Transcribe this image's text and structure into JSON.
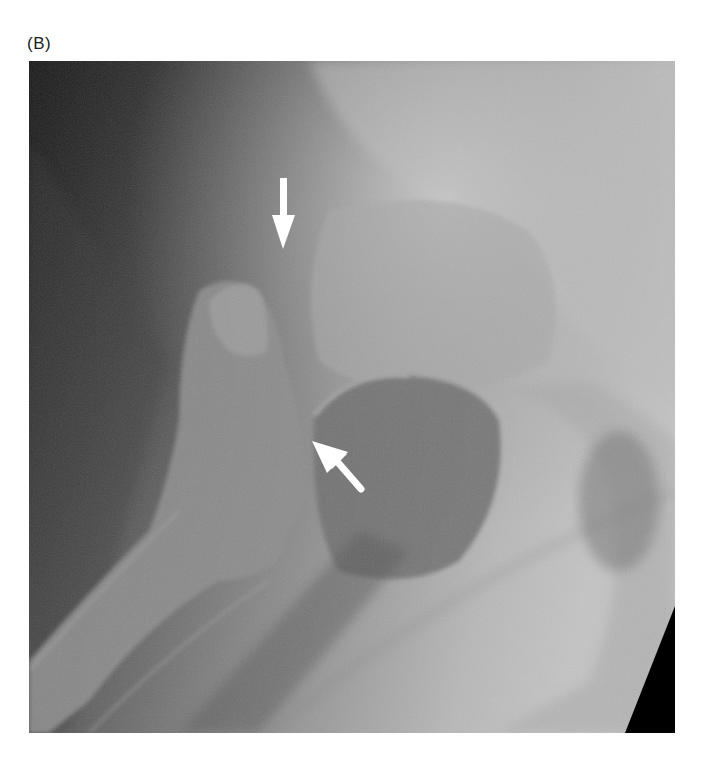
{
  "figure": {
    "panel_label": "(B)",
    "image": {
      "subject": "hip radiograph",
      "annotations": [
        {
          "name": "arrow-down",
          "direction": "down",
          "color": "#ffffff"
        },
        {
          "name": "arrow-up-left",
          "direction": "up-left",
          "color": "#ffffff"
        }
      ]
    }
  }
}
